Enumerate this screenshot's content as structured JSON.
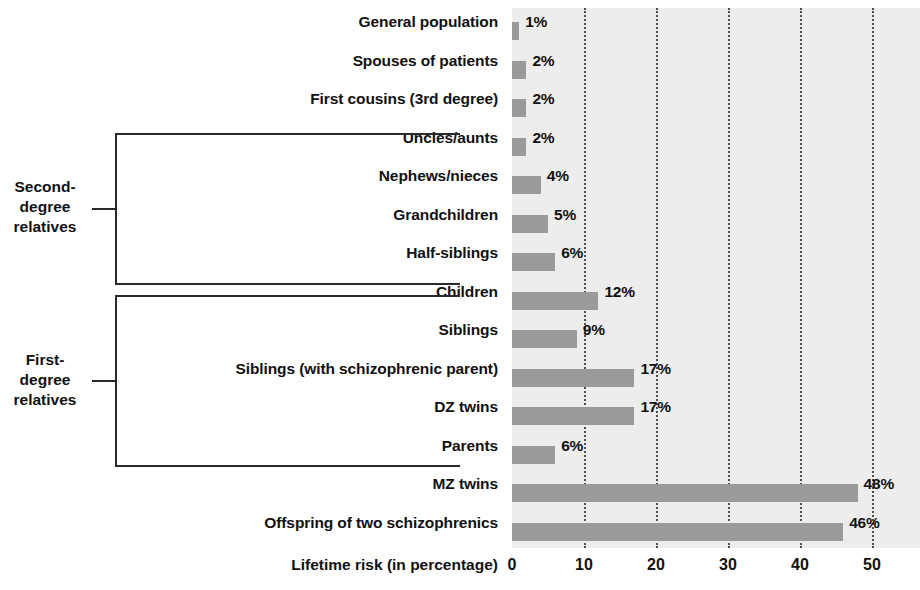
{
  "chart_data": {
    "type": "bar",
    "orientation": "horizontal",
    "title": "",
    "xlabel": "Lifetime risk (in percentage)",
    "ylabel": "",
    "xlim": [
      0,
      56.6
    ],
    "xticks": [
      0,
      10,
      20,
      30,
      40,
      50
    ],
    "grid": "vertical-dotted",
    "legend": "none",
    "categories": [
      "General population",
      "Spouses of patients",
      "First cousins (3rd degree)",
      "Uncles/aunts",
      "Nephews/nieces",
      "Grandchildren",
      "Half-siblings",
      "Children",
      "Siblings",
      "Siblings (with schizophrenic parent)",
      "DZ twins",
      "Parents",
      "MZ twins",
      "Offspring of two schizophrenics"
    ],
    "values": [
      1,
      2,
      2,
      2,
      4,
      5,
      6,
      12,
      9,
      17,
      17,
      6,
      48,
      46
    ],
    "value_labels": [
      "1%",
      "2%",
      "2%",
      "2%",
      "4%",
      "5%",
      "6%",
      "12%",
      "9%",
      "17%",
      "17%",
      "6%",
      "48%",
      "46%"
    ],
    "annotations": [
      {
        "label": "Second-\ndegree\nrelatives",
        "covers": [
          "Uncles/aunts",
          "Nephews/nieces",
          "Grandchildren",
          "Half-siblings"
        ]
      },
      {
        "label": "First-\ndegree\nrelatives",
        "covers": [
          "Children",
          "Siblings",
          "Siblings (with schizophrenic parent)",
          "DZ twins",
          "Parents"
        ]
      }
    ],
    "colors": {
      "bar": "#9a9a9a",
      "plot_background": "#ededed",
      "page_background": "#ffffff",
      "gridline": "#4d4d4d",
      "bracket": "#2a2a2a",
      "text": "#111111"
    }
  },
  "axis": {
    "tick_labels": [
      "0",
      "10",
      "20",
      "30",
      "40",
      "50"
    ],
    "x_title": "Lifetime risk (in percentage)"
  },
  "brackets": [
    {
      "line1": "Second-",
      "line2": "degree",
      "line3": "relatives"
    },
    {
      "line1": "First-",
      "line2": "degree",
      "line3": "relatives"
    }
  ]
}
